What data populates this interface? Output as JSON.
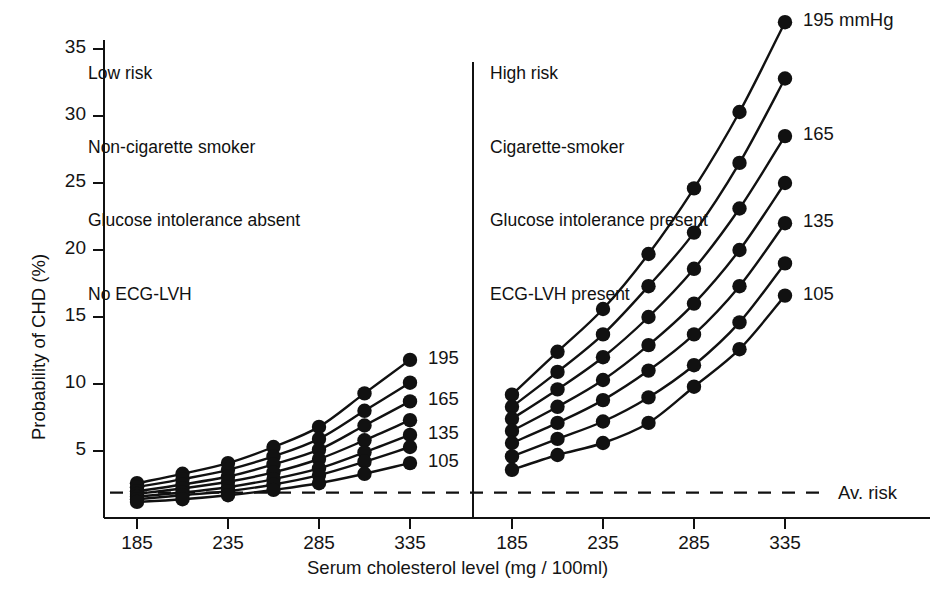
{
  "figure": {
    "background": "#ffffff",
    "ink": "#111111",
    "width": 938,
    "height": 602
  },
  "axes": {
    "y_title": "Probability of CHD (%)",
    "x_title": "Serum cholesterol level (mg / 100ml)",
    "y_ticks": [
      "5",
      "10",
      "15",
      "20",
      "25",
      "30",
      "35"
    ],
    "x_ticks": [
      "185",
      "235",
      "285",
      "335"
    ],
    "average_risk_label": "Av. risk",
    "unit_label": "195 mmHg"
  },
  "panels": {
    "left": {
      "annotation": [
        "Low risk",
        "Non-cigarette smoker",
        "Glucose intolerance absent",
        "No ECG-LVH"
      ],
      "end_labels": [
        "195",
        "165",
        "135",
        "105"
      ]
    },
    "right": {
      "annotation": [
        "High risk",
        "Cigarette-smoker",
        "Glucose intolerance present",
        "ECG-LVH present"
      ],
      "end_labels": [
        "195 mmHg",
        "165",
        "135",
        "105"
      ]
    }
  },
  "chart_data": {
    "type": "line",
    "title": "",
    "xlabel": "Serum cholesterol level (mg / 100ml)",
    "ylabel": "Probability of CHD (%)",
    "xlim": [
      185,
      335
    ],
    "ylim": [
      0,
      37
    ],
    "xticks": [
      185,
      235,
      285,
      335
    ],
    "yticks": [
      5,
      10,
      15,
      20,
      25,
      30,
      35
    ],
    "x": [
      185,
      210,
      235,
      260,
      285,
      310,
      335
    ],
    "grid": false,
    "legend": "series end labels at right of each curve; values are systolic blood pressure in mmHg",
    "annotations": [
      {
        "text": "Av. risk",
        "type": "dashed-horizontal-line",
        "y": 1.9
      }
    ],
    "panels": [
      {
        "name": "Low risk",
        "conditions": [
          "Low risk",
          "Non-cigarette smoker",
          "Glucose intolerance absent",
          "No ECG-LVH"
        ],
        "series": [
          {
            "name": "195",
            "label": "195",
            "values": [
              2.6,
              3.3,
              4.1,
              5.3,
              6.8,
              9.3,
              11.8
            ]
          },
          {
            "name": "185",
            "label": "",
            "values": [
              2.3,
              2.9,
              3.6,
              4.6,
              5.9,
              8.0,
              10.1
            ]
          },
          {
            "name": "165",
            "label": "165",
            "values": [
              2.0,
              2.5,
              3.1,
              4.0,
              5.1,
              6.9,
              8.7
            ]
          },
          {
            "name": "150",
            "label": "",
            "values": [
              1.8,
              2.2,
              2.7,
              3.4,
              4.4,
              5.8,
              7.3
            ]
          },
          {
            "name": "135",
            "label": "135",
            "values": [
              1.6,
              1.9,
              2.3,
              2.9,
              3.7,
              4.9,
              6.2
            ]
          },
          {
            "name": "120",
            "label": "",
            "values": [
              1.4,
              1.7,
              2.0,
              2.5,
              3.2,
              4.2,
              5.3
            ]
          },
          {
            "name": "105",
            "label": "105",
            "values": [
              1.2,
              1.4,
              1.7,
              2.1,
              2.6,
              3.3,
              4.1
            ]
          }
        ]
      },
      {
        "name": "High risk",
        "conditions": [
          "High risk",
          "Cigarette-smoker",
          "Glucose intolerance present",
          "ECG-LVH present"
        ],
        "series": [
          {
            "name": "195",
            "label": "195 mmHg",
            "values": [
              9.2,
              12.4,
              15.6,
              19.7,
              24.6,
              30.3,
              37.0
            ]
          },
          {
            "name": "185",
            "label": "",
            "values": [
              8.3,
              10.9,
              13.7,
              17.3,
              21.3,
              26.5,
              32.8
            ]
          },
          {
            "name": "165",
            "label": "165",
            "values": [
              7.4,
              9.6,
              12.0,
              15.0,
              18.6,
              23.1,
              28.5
            ]
          },
          {
            "name": "150",
            "label": "",
            "values": [
              6.5,
              8.3,
              10.3,
              12.9,
              16.0,
              20.0,
              25.0
            ]
          },
          {
            "name": "135",
            "label": "135",
            "values": [
              5.6,
              7.1,
              8.8,
              11.0,
              13.7,
              17.3,
              22.0
            ]
          },
          {
            "name": "120",
            "label": "",
            "values": [
              4.6,
              5.9,
              7.2,
              9.0,
              11.4,
              14.6,
              19.0
            ]
          },
          {
            "name": "105",
            "label": "105",
            "values": [
              3.6,
              4.7,
              5.6,
              7.1,
              9.8,
              12.6,
              16.6
            ]
          }
        ]
      }
    ]
  }
}
